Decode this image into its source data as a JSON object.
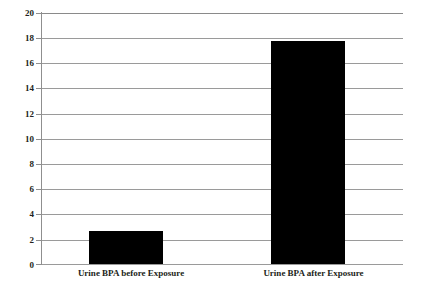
{
  "chart_data": {
    "type": "bar",
    "title": "",
    "subtitle": "",
    "xlabel": "",
    "ylabel": "",
    "categories": [
      "Urine BPA before Exposure",
      "Urine BPA after Exposure"
    ],
    "values": [
      2.6,
      17.8
    ],
    "series": [
      {
        "name": "Urine BPA",
        "values": [
          2.6,
          17.8
        ]
      }
    ],
    "ylim": [
      0,
      20
    ],
    "ytick_labels": [
      "20",
      "18",
      "16",
      "14",
      "12",
      "10",
      "8",
      "6",
      "4",
      "2",
      "0"
    ],
    "ytick_values": [
      20,
      18,
      16,
      14,
      12,
      10,
      8,
      6,
      4,
      2,
      0
    ],
    "grid": true,
    "grid_axis": "y",
    "legend": false,
    "legend_position": "none",
    "bar_color": "#000000",
    "grid_color": "#9a9a9a",
    "axis_color": "#8f8f8f",
    "text_color": "#231f20",
    "background_color": "#ffffff"
  }
}
